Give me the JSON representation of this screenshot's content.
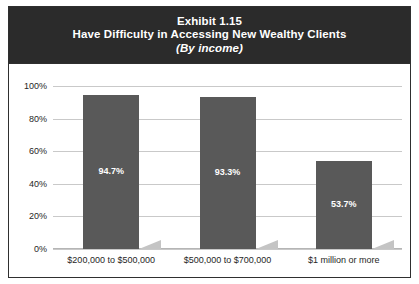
{
  "title": {
    "exhibit": "Exhibit 1.15",
    "headline": "Have Difficulty in Accessing New Wealthy Clients",
    "subtitle": "(By income)"
  },
  "colors": {
    "banner_bg": "#2b2b2b",
    "banner_text": "#ffffff",
    "bar_fill": "#595959",
    "bar_shadow": "#c4c4c4",
    "gridline": "#c9c9c9",
    "frame": "#2f2f2f",
    "plot_bg": "#ffffff",
    "tick_text": "#262626"
  },
  "chart_data": {
    "type": "bar",
    "xlabel": "",
    "ylabel": "",
    "categories": [
      "$200,000 to $500,000",
      "$500,000 to $700,000",
      "$1 million or more"
    ],
    "values": [
      94.7,
      93.3,
      53.7
    ],
    "value_labels": [
      "94.7%",
      "93.3%",
      "53.7%"
    ],
    "ylim": [
      0,
      100
    ],
    "yticks": [
      0,
      20,
      40,
      60,
      80,
      100
    ],
    "ytick_labels": [
      "0%",
      "20%",
      "40%",
      "60%",
      "80%",
      "100%"
    ],
    "grid": true,
    "legend": false,
    "legend_position": "none",
    "series": [
      {
        "name": "Have difficulty",
        "values": [
          94.7,
          93.3,
          53.7
        ]
      }
    ]
  }
}
